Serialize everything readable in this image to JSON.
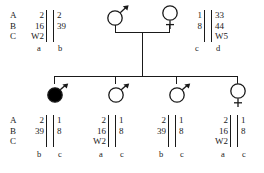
{
  "figure": {
    "type": "pedigree-haplotype",
    "loci": [
      "A",
      "B",
      "C"
    ],
    "generations": [
      {
        "id": "I",
        "individuals": [
          {
            "name": "father",
            "symbol": "mars",
            "affected": false,
            "haplotypes": [
              {
                "letter": "a",
                "alleles": [
                  "2",
                  "16",
                  "W2"
                ]
              },
              {
                "letter": "b",
                "alleles": [
                  "2",
                  "39",
                  ""
                ]
              }
            ]
          },
          {
            "name": "mother",
            "symbol": "venus",
            "affected": false,
            "haplotypes": [
              {
                "letter": "c",
                "alleles": [
                  "1",
                  "8",
                  ""
                ]
              },
              {
                "letter": "d",
                "alleles": [
                  "33",
                  "44",
                  "W5"
                ]
              }
            ]
          }
        ]
      },
      {
        "id": "II",
        "individuals": [
          {
            "name": "child-1",
            "symbol": "mars",
            "affected": true,
            "haplotypes": [
              {
                "letter": "b",
                "alleles": [
                  "2",
                  "39",
                  ""
                ]
              },
              {
                "letter": "c",
                "alleles": [
                  "1",
                  "8",
                  ""
                ]
              }
            ]
          },
          {
            "name": "child-2",
            "symbol": "mars",
            "affected": false,
            "haplotypes": [
              {
                "letter": "a",
                "alleles": [
                  "2",
                  "16",
                  "W2"
                ]
              },
              {
                "letter": "c",
                "alleles": [
                  "1",
                  "8",
                  ""
                ]
              }
            ]
          },
          {
            "name": "child-3",
            "symbol": "mars",
            "affected": false,
            "haplotypes": [
              {
                "letter": "b",
                "alleles": [
                  "2",
                  "39",
                  ""
                ]
              },
              {
                "letter": "c",
                "alleles": [
                  "1",
                  "8",
                  ""
                ]
              }
            ]
          },
          {
            "name": "child-4",
            "symbol": "venus",
            "affected": false,
            "haplotypes": [
              {
                "letter": "a",
                "alleles": [
                  "2",
                  "16",
                  "W2"
                ]
              },
              {
                "letter": "c",
                "alleles": [
                  "1",
                  "8",
                  ""
                ]
              }
            ]
          }
        ]
      }
    ],
    "colors": {
      "line": "#1a1a1a",
      "affected_fill": "#000000",
      "unaffected_fill": "#ffffff"
    }
  }
}
